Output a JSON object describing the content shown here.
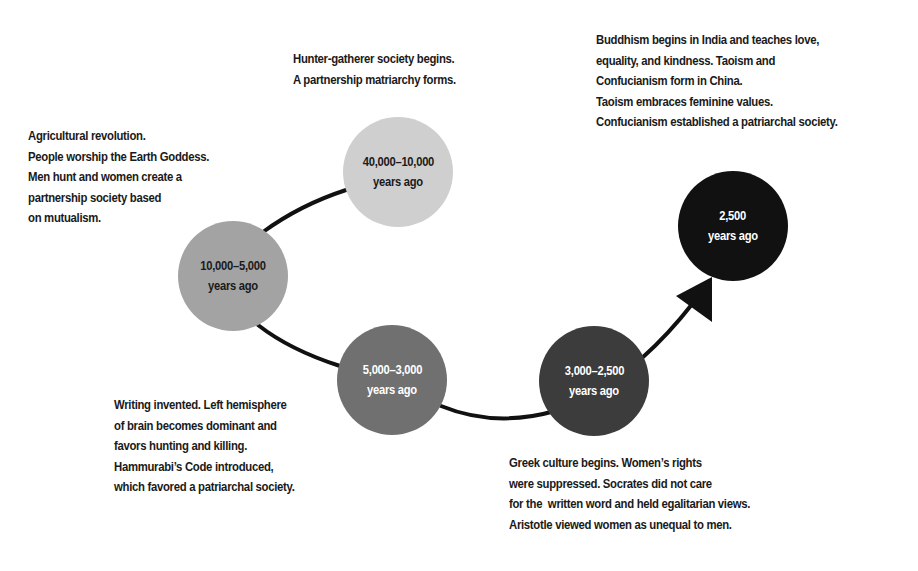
{
  "diagram": {
    "type": "timeline-path",
    "stages": [
      {
        "id": "stage-1",
        "period": "40,000–10,000",
        "unit": "years ago",
        "fill": "#cfcfcf",
        "text_color": "#1a1a1a",
        "description": [
          "Hunter-gatherer society begins.",
          "A partnership matriarchy forms."
        ]
      },
      {
        "id": "stage-2",
        "period": "10,000–5,000",
        "unit": "years ago",
        "fill": "#a3a3a3",
        "text_color": "#1a1a1a",
        "description": [
          "Agricultural revolution.",
          "People worship the Earth Goddess.",
          "Men hunt and women create a",
          "partnership society based",
          "on mutualism."
        ]
      },
      {
        "id": "stage-3",
        "period": "5,000–3,000",
        "unit": "years ago",
        "fill": "#707070",
        "text_color": "#ffffff",
        "description": [
          "Writing invented. Left hemisphere",
          "of brain becomes dominant and",
          "favors hunting and killing.",
          "Hammurabi’s Code introduced,",
          "which favored a patriarchal society."
        ]
      },
      {
        "id": "stage-4",
        "period": "3,000–2,500",
        "unit": "years ago",
        "fill": "#3c3c3c",
        "text_color": "#ffffff",
        "description": [
          "Greek culture begins. Women’s rights",
          "were suppressed. Socrates did not care",
          "for the  written word and held egalitarian views.",
          "Aristotle viewed women as unequal to men."
        ]
      },
      {
        "id": "stage-5",
        "period": "2,500",
        "unit": "years ago",
        "fill": "#111111",
        "text_color": "#ffffff",
        "description": [
          "Buddhism begins in India and teaches love,",
          "equality, and kindness. Taoism and",
          "Confucianism form in China.",
          "Taoism embraces feminine values.",
          "Confucianism established a patriarchal society."
        ]
      }
    ],
    "connector_color": "#111111",
    "arrow": "arrowhead-pointing-to-stage-5"
  }
}
